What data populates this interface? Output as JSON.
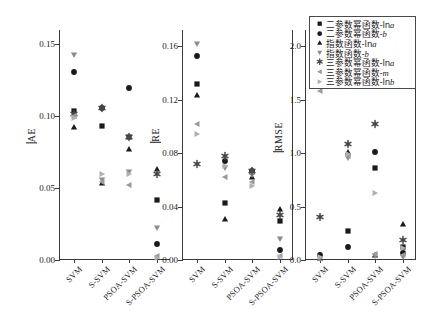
{
  "chart_data": {
    "type": "scatter",
    "title": "",
    "panels": [
      {
        "id": "ae",
        "ylabel": "AE",
        "ylim": [
          0.0,
          0.16
        ],
        "yticks": [
          0.0,
          0.05,
          0.1,
          0.15
        ],
        "ytick_labels": [
          "0.00",
          "0.05",
          "0.10",
          "0.15"
        ],
        "categories": [
          "SVM",
          "S-SVM",
          "PSOA-SVM",
          "S-PSOA-SVM"
        ],
        "series": [
          {
            "name": "two-param-power-lna",
            "marker": "square",
            "values": [
              0.1035,
              0.093,
              0.0855,
              0.042
            ]
          },
          {
            "name": "two-param-power-b",
            "marker": "circle",
            "values": [
              0.131,
              0.1055,
              0.12,
              0.011
            ]
          },
          {
            "name": "exp-lna",
            "marker": "triangle-up",
            "values": [
              0.0925,
              0.0535,
              0.077,
              0.0635
            ]
          },
          {
            "name": "exp-b",
            "marker": "triangle-down",
            "values": [
              0.1425,
              0.0555,
              0.061,
              0.0225
            ]
          },
          {
            "name": "three-param-power-lna",
            "marker": "asterisk",
            "values": [
              0.1015,
              0.1055,
              0.0855,
              0.0595
            ]
          },
          {
            "name": "three-param-power-m",
            "marker": "triangle-left",
            "values": [
              0.1,
              0.054,
              0.052,
              0.003
            ]
          },
          {
            "name": "three-param-power-lnb",
            "marker": "triangle-right",
            "values": [
              0.099,
              0.06,
              0.0595,
              0.0015
            ]
          }
        ]
      },
      {
        "id": "re",
        "ylabel": "RE",
        "ylim": [
          0.0,
          0.172
        ],
        "yticks": [
          0.0,
          0.04,
          0.08,
          0.12,
          0.16
        ],
        "ytick_labels": [
          "0.00",
          "0.04",
          "0.08",
          "0.12",
          "0.16"
        ],
        "categories": [
          "SVM",
          "S-SVM",
          "PSOA-SVM",
          "S-PSOA-SVM"
        ],
        "series": [
          {
            "name": "two-param-power-lna",
            "marker": "square",
            "values": [
              0.1315,
              0.043,
              0.066,
              0.029
            ]
          },
          {
            "name": "two-param-power-b",
            "marker": "circle",
            "values": [
              0.1525,
              0.074,
              0.0665,
              0.0075
            ]
          },
          {
            "name": "exp-lna",
            "marker": "triangle-up",
            "values": [
              0.1235,
              0.031,
              0.062,
              0.0385
            ]
          },
          {
            "name": "exp-b",
            "marker": "triangle-down",
            "values": [
              0.1615,
              0.0685,
              0.0635,
              0.016
            ]
          },
          {
            "name": "three-param-power-lna",
            "marker": "asterisk",
            "values": [
              0.0715,
              0.078,
              0.0665,
              0.034
            ]
          },
          {
            "name": "three-param-power-m",
            "marker": "triangle-left",
            "values": [
              0.102,
              0.062,
              0.058,
              0.003
            ]
          },
          {
            "name": "three-param-power-lnb",
            "marker": "triangle-right",
            "values": [
              0.0945,
              0.07,
              0.055,
              0.002
            ]
          }
        ]
      },
      {
        "id": "rmse",
        "ylabel": "RMSE",
        "ylim": [
          0.0,
          2.15
        ],
        "yticks": [
          0.0,
          0.5,
          1.0,
          1.5,
          2.0
        ],
        "ytick_labels": [
          "0.0",
          "0.5",
          "1.0",
          "1.5",
          "2.0"
        ],
        "categories": [
          "SVM",
          "S-SVM",
          "PSOA-SVM",
          "S-PSOA-SVM"
        ],
        "series": [
          {
            "name": "two-param-power-lna",
            "marker": "square",
            "values": [
              1.78,
              0.27,
              0.86,
              0.12
            ]
          },
          {
            "name": "two-param-power-b",
            "marker": "circle",
            "values": [
              0.05,
              0.12,
              1.01,
              0.07
            ]
          },
          {
            "name": "exp-lna",
            "marker": "triangle-up",
            "values": [
              0.02,
              1.01,
              0.05,
              0.34
            ]
          },
          {
            "name": "exp-b",
            "marker": "triangle-down",
            "values": [
              0.01,
              0.95,
              0.04,
              0.03
            ]
          },
          {
            "name": "three-param-power-lna",
            "marker": "asterisk",
            "values": [
              0.4,
              1.08,
              1.27,
              0.19
            ]
          },
          {
            "name": "three-param-power-m",
            "marker": "triangle-left",
            "values": [
              1.58,
              0.97,
              0.06,
              0.05
            ]
          },
          {
            "name": "three-param-power-lnb",
            "marker": "triangle-right",
            "values": [
              0.03,
              0.99,
              0.63,
              0.11
            ]
          }
        ]
      }
    ],
    "legend": {
      "position": "top-right",
      "entries": [
        {
          "marker": "square",
          "label": "二参数幂函数-ln",
          "italic": "a"
        },
        {
          "marker": "circle",
          "label": "二参数幂函数-",
          "italic": "b"
        },
        {
          "marker": "triangle-up",
          "label": "指数函数-ln",
          "italic": "a"
        },
        {
          "marker": "triangle-down",
          "label": "指数函数-",
          "italic": "b"
        },
        {
          "marker": "asterisk",
          "label": "三参数幂函数-ln",
          "italic": "a"
        },
        {
          "marker": "triangle-left",
          "label": "三参数幂函数-",
          "italic": "m"
        },
        {
          "marker": "triangle-right",
          "label": "三参数幂函数-ln",
          "italic": "b"
        }
      ]
    },
    "marker_colors": {
      "square": "#1a1a1a",
      "circle": "#1a1a1a",
      "triangle-up": "#1a1a1a",
      "triangle-down": "#8c8c8c",
      "asterisk": "#4a4a4a",
      "triangle-left": "#9a9a9a",
      "triangle-right": "#b0b0b0"
    },
    "grid": false,
    "axis_color": "#3a3a3a"
  }
}
